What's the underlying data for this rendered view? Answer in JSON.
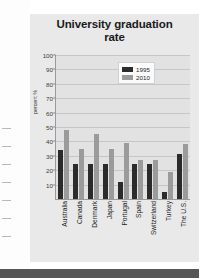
{
  "figure": {
    "title_line1": "University graduation",
    "title_line2": "rate"
  },
  "chart_data": {
    "type": "bar",
    "title": "University graduation rate",
    "xlabel": "",
    "ylabel": "percent %",
    "ylim": [
      0,
      100
    ],
    "yticks": [
      10,
      20,
      30,
      40,
      50,
      60,
      70,
      80,
      90,
      100
    ],
    "grid": true,
    "legend_position": "upper right",
    "categories": [
      "Australia",
      "Canada",
      "Denmark",
      "Japan",
      "Portugal",
      "Spain",
      "Switzerland",
      "Turkey",
      "The U.S."
    ],
    "series": [
      {
        "name": "1995",
        "color": "#2b2b2b",
        "values": [
          34,
          24,
          24,
          24,
          12,
          24,
          24,
          5,
          31
        ]
      },
      {
        "name": "2010",
        "color": "#9b9b9b",
        "values": [
          48,
          35,
          45,
          35,
          39,
          27,
          27,
          19,
          38
        ]
      }
    ]
  }
}
